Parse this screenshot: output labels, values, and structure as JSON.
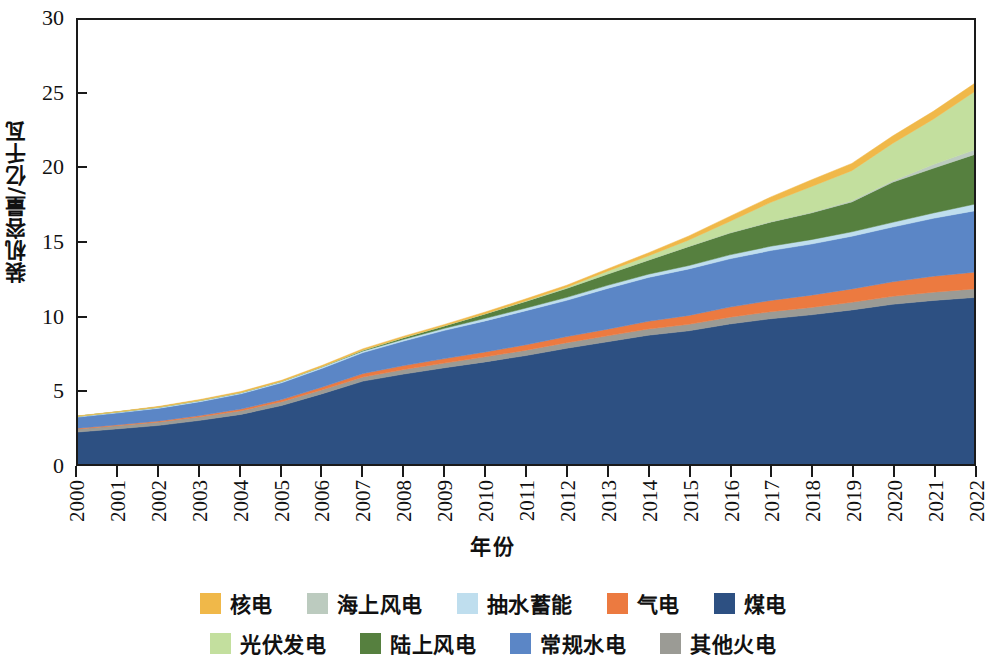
{
  "chart_data": {
    "type": "area",
    "stacked": true,
    "title": "",
    "xlabel": "年份",
    "ylabel": "装机容量/亿千瓦",
    "x": [
      2000,
      2001,
      2002,
      2003,
      2004,
      2005,
      2006,
      2007,
      2008,
      2009,
      2010,
      2011,
      2012,
      2013,
      2014,
      2015,
      2016,
      2017,
      2018,
      2019,
      2020,
      2021,
      2022
    ],
    "categories": [
      "2000",
      "2001",
      "2002",
      "2003",
      "2004",
      "2005",
      "2006",
      "2007",
      "2008",
      "2009",
      "2010",
      "2011",
      "2012",
      "2013",
      "2014",
      "2015",
      "2016",
      "2017",
      "2018",
      "2019",
      "2020",
      "2021",
      "2022"
    ],
    "xtick_labels": [
      "2000",
      "2001",
      "2002",
      "2003",
      "2004",
      "2005",
      "2006",
      "2007",
      "2008",
      "2009",
      "2010",
      "2011",
      "2012",
      "2013",
      "2014",
      "2015",
      "2016",
      "2017",
      "2018",
      "2019",
      "2020",
      "2021",
      "2022"
    ],
    "ytick_labels": [
      "0",
      "5",
      "10",
      "15",
      "20",
      "25",
      "30"
    ],
    "ytick_values": [
      0,
      5,
      10,
      15,
      20,
      25,
      30
    ],
    "ylim": [
      0,
      30
    ],
    "xlim": [
      2000,
      2022
    ],
    "grid": false,
    "legend_position": "bottom",
    "stack_order_bottom_to_top": [
      "煤电",
      "其他火电",
      "气电",
      "常规水电",
      "抽水蓄能",
      "陆上风电",
      "海上风电",
      "光伏发电",
      "核电"
    ],
    "series": [
      {
        "name": "煤电",
        "color": "#2d5082",
        "values": [
          2.16,
          2.38,
          2.61,
          2.95,
          3.35,
          3.95,
          4.75,
          5.6,
          6.08,
          6.5,
          6.9,
          7.33,
          7.82,
          8.26,
          8.7,
          9.0,
          9.46,
          9.81,
          10.08,
          10.41,
          10.79,
          11.05,
          11.25
        ]
      },
      {
        "name": "其他火电",
        "color": "#9b9b95",
        "values": [
          0.21,
          0.22,
          0.23,
          0.24,
          0.25,
          0.26,
          0.27,
          0.28,
          0.3,
          0.32,
          0.34,
          0.36,
          0.38,
          0.4,
          0.42,
          0.44,
          0.46,
          0.48,
          0.5,
          0.52,
          0.54,
          0.56,
          0.58
        ]
      },
      {
        "name": "气电",
        "color": "#ec7a40",
        "values": [
          0.05,
          0.06,
          0.07,
          0.09,
          0.11,
          0.14,
          0.18,
          0.23,
          0.27,
          0.3,
          0.33,
          0.37,
          0.41,
          0.45,
          0.52,
          0.6,
          0.68,
          0.76,
          0.83,
          0.9,
          0.98,
          1.08,
          1.13
        ]
      },
      {
        "name": "常规水电",
        "color": "#5b86c6",
        "values": [
          0.75,
          0.8,
          0.86,
          0.93,
          1.03,
          1.14,
          1.27,
          1.42,
          1.66,
          1.91,
          2.1,
          2.3,
          2.45,
          2.75,
          2.96,
          3.14,
          3.26,
          3.37,
          3.45,
          3.56,
          3.7,
          3.91,
          4.14
        ]
      },
      {
        "name": "抽水蓄能",
        "color": "#bfdeee",
        "values": [
          0.06,
          0.06,
          0.07,
          0.08,
          0.08,
          0.09,
          0.1,
          0.11,
          0.12,
          0.14,
          0.17,
          0.18,
          0.2,
          0.21,
          0.22,
          0.23,
          0.27,
          0.29,
          0.3,
          0.3,
          0.32,
          0.36,
          0.45
        ]
      },
      {
        "name": "陆上风电",
        "color": "#56803f",
        "values": [
          0.0,
          0.01,
          0.01,
          0.01,
          0.01,
          0.01,
          0.02,
          0.06,
          0.12,
          0.17,
          0.31,
          0.46,
          0.61,
          0.76,
          0.95,
          1.29,
          1.47,
          1.63,
          1.8,
          2.02,
          2.71,
          3.02,
          3.35
        ]
      },
      {
        "name": "海上风电",
        "color": "#bccbbf",
        "values": [
          0.0,
          0.0,
          0.0,
          0.0,
          0.0,
          0.0,
          0.0,
          0.0,
          0.0,
          0.0,
          0.0,
          0.0,
          0.01,
          0.01,
          0.01,
          0.01,
          0.02,
          0.03,
          0.04,
          0.07,
          0.09,
          0.26,
          0.31
        ]
      },
      {
        "name": "光伏发电",
        "color": "#c3df9e",
        "values": [
          0.0,
          0.0,
          0.0,
          0.0,
          0.0,
          0.0,
          0.0,
          0.0,
          0.0,
          0.0,
          0.01,
          0.03,
          0.07,
          0.19,
          0.28,
          0.43,
          0.77,
          1.3,
          1.74,
          2.04,
          2.53,
          3.06,
          3.93
        ]
      },
      {
        "name": "核电",
        "color": "#f0b849",
        "values": [
          0.02,
          0.02,
          0.05,
          0.06,
          0.07,
          0.07,
          0.08,
          0.09,
          0.09,
          0.09,
          0.11,
          0.13,
          0.13,
          0.15,
          0.2,
          0.27,
          0.34,
          0.36,
          0.45,
          0.49,
          0.5,
          0.53,
          0.55
        ]
      }
    ]
  },
  "legend": {
    "rows": [
      [
        {
          "label": "核电",
          "color": "#f0b849"
        },
        {
          "label": "海上风电",
          "color": "#bccbbf"
        },
        {
          "label": "抽水蓄能",
          "color": "#bfdeee"
        },
        {
          "label": "气电",
          "color": "#ec7a40"
        },
        {
          "label": "煤电",
          "color": "#2d5082"
        }
      ],
      [
        {
          "label": "光伏发电",
          "color": "#c3df9e"
        },
        {
          "label": "陆上风电",
          "color": "#56803f"
        },
        {
          "label": "常规水电",
          "color": "#5b86c6"
        },
        {
          "label": "其他火电",
          "color": "#9b9b95"
        }
      ]
    ]
  },
  "axes": {
    "y_title": "装机容量/亿千瓦",
    "x_title": "年份"
  }
}
